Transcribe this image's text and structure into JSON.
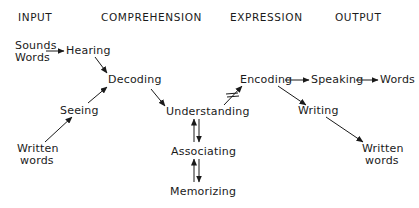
{
  "headers": {
    "input": "INPUT",
    "comprehension": "COMPREHENSION",
    "expression": "EXPRESSION",
    "output": "OUTPUT"
  },
  "nodes": {
    "sounds_words": {
      "line1": "Sounds",
      "line2": "Words"
    },
    "hearing": "Hearing",
    "decoding": "Decoding",
    "seeing": "Seeing",
    "written_words_in": {
      "line1": "Written",
      "line2": "words"
    },
    "understanding": "Understanding",
    "associating": "Associating",
    "memorizing": "Memorizing",
    "encoding": "Encoding",
    "speaking": "Speaking",
    "words_out": "Words",
    "writing": "Writing",
    "written_words_out": {
      "line1": "Written",
      "line2": "words"
    }
  },
  "edges": [
    {
      "from": "Sounds Words",
      "to": "Hearing",
      "type": "arrow"
    },
    {
      "from": "Hearing",
      "to": "Decoding",
      "type": "arrow"
    },
    {
      "from": "Written words",
      "to": "Seeing",
      "type": "arrow"
    },
    {
      "from": "Seeing",
      "to": "Decoding",
      "type": "arrow"
    },
    {
      "from": "Decoding",
      "to": "Understanding",
      "type": "arrow"
    },
    {
      "from": "Understanding",
      "to": "Encoding",
      "type": "arrow",
      "note": "crossed with double bar (not equal)"
    },
    {
      "from": "Understanding",
      "to": "Associating",
      "type": "bidirectional"
    },
    {
      "from": "Associating",
      "to": "Memorizing",
      "type": "bidirectional"
    },
    {
      "from": "Encoding",
      "to": "Speaking",
      "type": "arrow"
    },
    {
      "from": "Speaking",
      "to": "Words",
      "type": "arrow"
    },
    {
      "from": "Encoding",
      "to": "Writing",
      "type": "arrow"
    },
    {
      "from": "Writing",
      "to": "Written words",
      "type": "arrow"
    }
  ]
}
